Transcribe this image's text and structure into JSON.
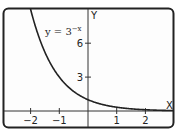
{
  "chart_data": {
    "type": "line",
    "title": "",
    "xlabel": "X",
    "ylabel": "Y",
    "xlim": [
      -2.6,
      3.0
    ],
    "ylim": [
      -1.4,
      9.2
    ],
    "x_ticks": [
      -2,
      -1,
      1,
      2
    ],
    "x_tick_labels": [
      "−2",
      "−1",
      "1",
      "2"
    ],
    "y_ticks": [
      3,
      6
    ],
    "y_tick_labels": [
      "3",
      "6"
    ],
    "grid": false,
    "series": [
      {
        "name": "y = 3^-x",
        "function": "3^(-x)",
        "x": [
          -2,
          -1.5,
          -1,
          -0.5,
          0,
          0.5,
          1,
          1.5,
          2,
          2.5
        ],
        "values": [
          9,
          5.2,
          3,
          1.73,
          1,
          0.58,
          0.33,
          0.19,
          0.11,
          0.06
        ]
      }
    ],
    "annotation": {
      "base": "y = 3",
      "exponent": "−x"
    }
  }
}
